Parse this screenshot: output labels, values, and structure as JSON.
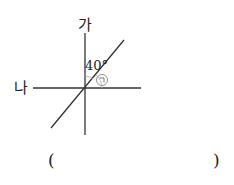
{
  "figure": {
    "line_labels": {
      "vertical": "가",
      "horizontal": "나"
    },
    "given_angle": "40°",
    "unknown_angle_marker": "ㄱ"
  },
  "answer": {
    "open_paren": "(",
    "close_paren": ")",
    "value": ""
  },
  "colors": {
    "line": "#333333",
    "marker": "#888888"
  }
}
